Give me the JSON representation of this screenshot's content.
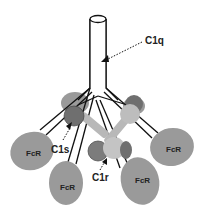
{
  "diagram": {
    "labels": {
      "c1q": "C1q",
      "c1s": "C1s",
      "c1r": "C1r",
      "fcr": "FcR"
    },
    "colors": {
      "background": "#ffffff",
      "stroke": "#111111",
      "fcr_head": "#9a9a9a",
      "c1s_dark": "#6f6f6f",
      "c1r_light": "#bdbdbd",
      "c1r_mid": "#8a8a8a",
      "text": "#222222"
    },
    "fcr_heads": [
      {
        "id": "left",
        "label": "FcR"
      },
      {
        "id": "bottom-left",
        "label": "FcR"
      },
      {
        "id": "bottom-right",
        "label": "FcR"
      },
      {
        "id": "right",
        "label": "FcR"
      }
    ]
  }
}
